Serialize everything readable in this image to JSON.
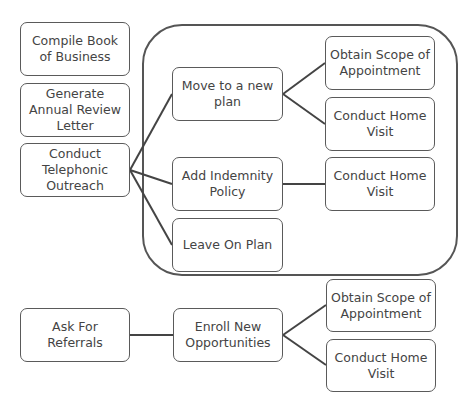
{
  "nodes": {
    "compile": "Compile Book of Business",
    "generate": "Generate Annual Review Letter",
    "telephonic": "Conduct Telephonic Outreach",
    "move": "Move to a new plan",
    "obtain1": "Obtain Scope of Appointment",
    "home1": "Conduct Home Visit",
    "add": "Add Indemnity Policy",
    "home2": "Conduct Home Visit",
    "leave": "Leave On Plan",
    "referrals": "Ask For Referrals",
    "enroll": "Enroll New Opportunities",
    "obtain2": "Obtain Scope of Appointment",
    "home3": "Conduct Home Visit"
  },
  "colors": {
    "stroke": "#555555",
    "text": "#444444",
    "background": "#ffffff"
  }
}
